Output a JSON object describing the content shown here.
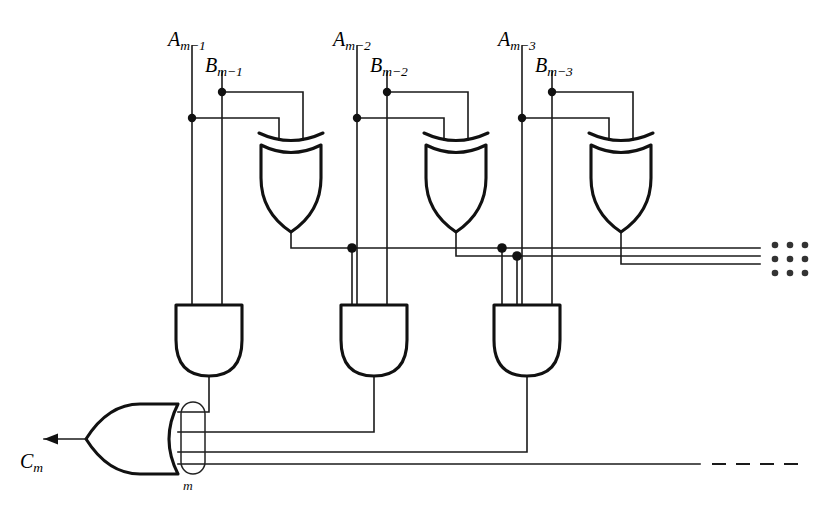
{
  "figure": {
    "type": "logic-circuit-diagram",
    "background_color": "#ffffff",
    "line_color": "#111111"
  },
  "signals": {
    "inputs": [
      {
        "id": "a1",
        "base": "A",
        "subscript": "m−1",
        "x": 168,
        "y": 28
      },
      {
        "id": "b1",
        "base": "B",
        "subscript": "m−1",
        "x": 205,
        "y": 54
      },
      {
        "id": "a2",
        "base": "A",
        "subscript": "m−2",
        "x": 333,
        "y": 28
      },
      {
        "id": "b2",
        "base": "B",
        "subscript": "m−2",
        "x": 370,
        "y": 54
      },
      {
        "id": "a3",
        "base": "A",
        "subscript": "m−3",
        "x": 498,
        "y": 28
      },
      {
        "id": "b3",
        "base": "B",
        "subscript": "m−3",
        "x": 535,
        "y": 54
      }
    ],
    "outputs": [
      {
        "id": "cm",
        "base": "C",
        "subscript": "m",
        "x": 20,
        "y": 450
      }
    ],
    "bundle_labels": [
      {
        "id": "bundle-m",
        "text": "m",
        "x": 183,
        "y": 478
      }
    ]
  },
  "gates": {
    "xor": [
      {
        "id": "xor-1",
        "label": "XOR",
        "cx": 291,
        "top": 135,
        "bottom": 228
      },
      {
        "id": "xor-2",
        "label": "XOR",
        "cx": 456,
        "top": 135,
        "bottom": 228
      },
      {
        "id": "xor-3",
        "label": "XOR",
        "cx": 621,
        "top": 135,
        "bottom": 228
      }
    ],
    "and": [
      {
        "id": "and-1",
        "label": "AND",
        "cx": 209,
        "top": 305,
        "bottom": 372,
        "inputs": 2
      },
      {
        "id": "and-2",
        "label": "AND",
        "cx": 374,
        "top": 305,
        "bottom": 372,
        "inputs": 3
      },
      {
        "id": "and-3",
        "label": "AND",
        "cx": 527,
        "top": 305,
        "bottom": 372,
        "inputs": 4
      }
    ],
    "or": [
      {
        "id": "or-1",
        "label": "OR",
        "x": 88,
        "y": 406,
        "width": 90,
        "height": 68,
        "inputs": 4
      }
    ]
  },
  "annotations": {
    "continuation_dots": {
      "rows": 3,
      "cols": 3,
      "x": 775,
      "y": 245,
      "spacing": 14
    },
    "dashed_continuation": {
      "y": 464,
      "x_start": 700,
      "x_end": 800
    }
  }
}
